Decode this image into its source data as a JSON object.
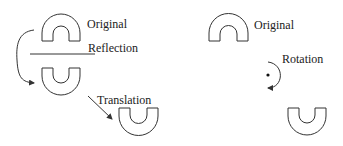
{
  "labels": {
    "left_original": "Original",
    "reflection": "Reflection",
    "translation": "Translation",
    "right_original": "Original",
    "rotation": "Rotation"
  },
  "colors": {
    "stroke": "#333333",
    "text": "#222222",
    "background": "#ffffff"
  }
}
